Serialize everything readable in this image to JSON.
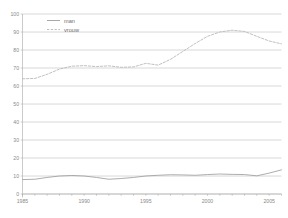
{
  "chart_data": {
    "type": "line",
    "title": "",
    "subtitle": "",
    "xlabel": "",
    "ylabel": "",
    "xlim": [
      1985,
      2006
    ],
    "ylim": [
      0,
      100
    ],
    "grid": true,
    "legend_position": "top-left",
    "x": [
      1985,
      1986,
      1987,
      1988,
      1989,
      1990,
      1991,
      1992,
      1993,
      1994,
      1995,
      1996,
      1997,
      1998,
      1999,
      2000,
      2001,
      2002,
      2003,
      2004,
      2005,
      2006
    ],
    "xticks": [
      1985,
      1986,
      1987,
      1988,
      1989,
      1990,
      1991,
      1992,
      1993,
      1994,
      1995,
      1996,
      1997,
      1998,
      1999,
      2000,
      2001,
      2002,
      2003,
      2004,
      2005,
      2006
    ],
    "xtick_labels": [
      "1985",
      "",
      "",
      "",
      "",
      "1990",
      "",
      "",
      "",
      "",
      "1995",
      "",
      "",
      "",
      "",
      "2000",
      "",
      "",
      "",
      "",
      "2005",
      ""
    ],
    "yticks": [
      0,
      10,
      20,
      30,
      40,
      50,
      60,
      70,
      80,
      90,
      100
    ],
    "ytick_labels": [
      "0",
      "10",
      "20",
      "30",
      "40",
      "50",
      "60",
      "70",
      "80",
      "90",
      "100"
    ],
    "series": [
      {
        "name": "man",
        "style": "solid",
        "color": "#9e9e9e",
        "values": [
          8.0,
          8.2,
          9.2,
          10.0,
          10.3,
          10.0,
          9.2,
          8.2,
          8.6,
          9.2,
          10.0,
          10.4,
          10.7,
          10.6,
          10.4,
          10.8,
          11.1,
          10.9,
          10.8,
          10.1,
          11.6,
          13.4
        ]
      },
      {
        "name": "vrouw",
        "style": "dashed",
        "color": "#b5b5b5",
        "values": [
          64.0,
          64.2,
          66.5,
          69.4,
          71.0,
          71.3,
          70.8,
          71.2,
          70.4,
          70.6,
          72.6,
          71.6,
          74.8,
          79.2,
          83.6,
          87.6,
          90.0,
          91.0,
          90.3,
          87.6,
          85.0,
          83.4
        ]
      }
    ],
    "series_vrouw_tail_note": ""
  },
  "legend": {
    "items": [
      {
        "label": "man",
        "style": "solid"
      },
      {
        "label": "vrouw",
        "style": "dashed"
      }
    ]
  },
  "axes": {
    "y_axis_name": "y-axis",
    "x_axis_name": "x-axis"
  }
}
